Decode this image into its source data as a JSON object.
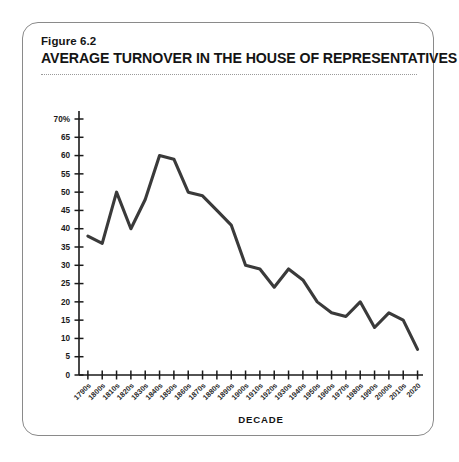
{
  "figure": {
    "number_label": "Figure 6.2",
    "title": "AVERAGE TURNOVER IN THE HOUSE OF REPRESENTATIVES"
  },
  "colors": {
    "line": "#3a3a3a",
    "axis": "#1a1a1a",
    "card_border": "#8a8a8a",
    "divider": "#9a9a9a",
    "text": "#141414",
    "background": "#ffffff"
  },
  "chart_data": {
    "type": "line",
    "title": "AVERAGE TURNOVER IN THE HOUSE OF REPRESENTATIVES",
    "xlabel": "DECADE",
    "ylabel": "",
    "ylim": [
      0,
      70
    ],
    "ytick_step": 5,
    "grid": false,
    "legend": "none",
    "ytick_labels": [
      "0",
      "5",
      "10",
      "15",
      "20",
      "25",
      "30",
      "35",
      "40",
      "45",
      "50",
      "55",
      "60",
      "65",
      "70%"
    ],
    "ytick_values": [
      0,
      5,
      10,
      15,
      20,
      25,
      30,
      35,
      40,
      45,
      50,
      55,
      60,
      65,
      70
    ],
    "categories": [
      "1790s",
      "1800s",
      "1810s",
      "1820s",
      "1830s",
      "1840s",
      "1850s",
      "1860s",
      "1870s",
      "1880s",
      "1890s",
      "1900s",
      "1910s",
      "1920s",
      "1930s",
      "1940s",
      "1950s",
      "1960s",
      "1970s",
      "1980s",
      "1990s",
      "2000s",
      "2010s",
      "2020"
    ],
    "values": [
      38,
      36,
      50,
      40,
      48,
      60,
      59,
      50,
      49,
      45,
      41,
      30,
      29,
      24,
      29,
      26,
      20,
      17,
      16,
      20,
      13,
      17,
      15,
      7
    ]
  }
}
